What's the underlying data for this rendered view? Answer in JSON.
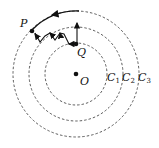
{
  "labels": {
    "P": "P",
    "Q": "Q",
    "O": "O",
    "C1": "C",
    "C1_sub": "1",
    "C2": "C",
    "C2_sub": "2",
    "C3": "C",
    "C3_sub": "3"
  },
  "diagram": {
    "center": [
      76,
      74
    ],
    "circles": [
      {
        "name": "C1",
        "radius": 31
      },
      {
        "name": "C2",
        "radius": 47
      },
      {
        "name": "C3",
        "radius": 63
      }
    ],
    "points": {
      "O": [
        76,
        74
      ],
      "Q": [
        76,
        44
      ],
      "P": [
        32,
        32
      ]
    }
  }
}
